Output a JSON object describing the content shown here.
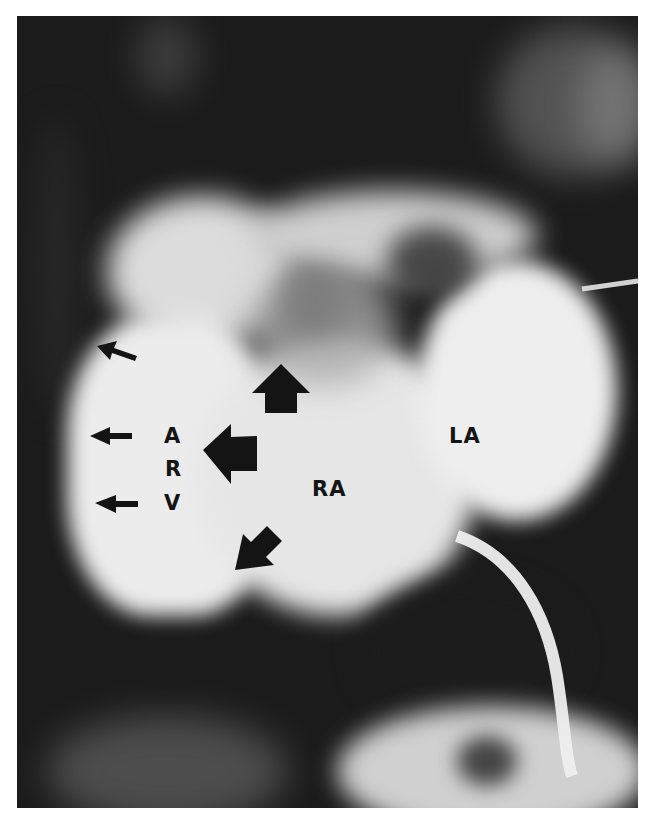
{
  "figure": {
    "type": "angiogram",
    "tone": "grayscale",
    "labels": {
      "arv_a": "A",
      "arv_r": "R",
      "arv_v": "V",
      "ra": "RA",
      "la": "LA"
    },
    "arrows": {
      "small_left_count": 3,
      "large": [
        "up",
        "left",
        "down-left"
      ]
    },
    "colors": {
      "background": "#ffffff",
      "film_dark": "#1b1b1b",
      "contrast_bright": "#e8e8e8",
      "marker": "#141414"
    }
  }
}
